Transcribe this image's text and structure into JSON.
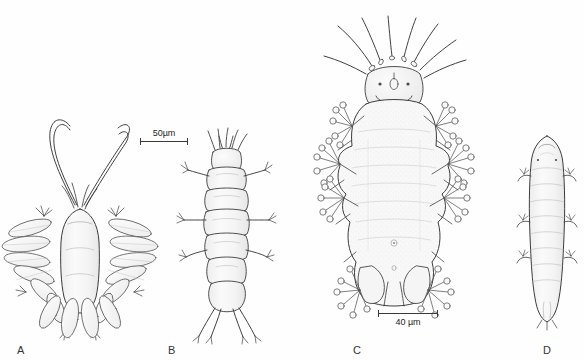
{
  "figure": {
    "background_color": "#fefefe",
    "ink_color": "#3a3a3a",
    "fill_color": "#f7f7f7",
    "shade_color": "#e9e9e9"
  },
  "panels": [
    {
      "id": "A",
      "label": "A",
      "subject": "mite-with-long-curved-antenniform-setae-and-leaf-like-setae",
      "description": "Dorsal view of mite with two very long curved whip-like setae arising anteriorly and fan-like arrangements of broad lanceolate leaf-shaped setae on each leg"
    },
    {
      "id": "B",
      "label": "B",
      "subject": "segmented-larva-dorsal-view",
      "description": "Dorsal view of an elongate segmented larva with transverse body segments, short spiky anterior setae and three pairs of lateral legs"
    },
    {
      "id": "C",
      "label": "C",
      "subject": "mite-with-knob-tipped-capitate-setae",
      "description": "Dorsal view of a broad mite bearing long straight anterior setae and clusters of knob-tipped capitate setae radiating from each of four pairs of legs"
    },
    {
      "id": "D",
      "label": "D",
      "subject": "elongate-vermiform-mite",
      "description": "Dorsal view of a slender elongate worm-like segmented mite with small reduced lateral legs"
    }
  ],
  "scale_bars": [
    {
      "id": "scale-bar-50um",
      "value": "50",
      "unit": "µm",
      "text": "50µm",
      "applies_to": "A, B"
    },
    {
      "id": "scale-bar-40um",
      "value": "40",
      "unit": "µm",
      "text": "40 µm",
      "applies_to": "C, D"
    }
  ]
}
